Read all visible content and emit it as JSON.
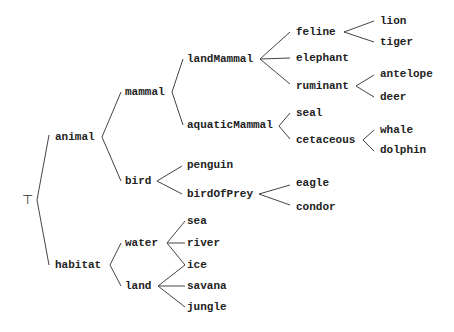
{
  "diagram": {
    "type": "taxonomy-tree",
    "root": "⊤",
    "nodes": [
      {
        "id": "top",
        "label": "⊤",
        "x": 22,
        "y": 200,
        "root": true
      },
      {
        "id": "animal",
        "label": "animal",
        "x": 55,
        "y": 137,
        "parent": "top"
      },
      {
        "id": "habitat",
        "label": "habitat",
        "x": 55,
        "y": 265,
        "parent": "top"
      },
      {
        "id": "mammal",
        "label": "mammal",
        "x": 125,
        "y": 92,
        "parent": "animal"
      },
      {
        "id": "bird",
        "label": "bird",
        "x": 125,
        "y": 181,
        "parent": "animal"
      },
      {
        "id": "landMammal",
        "label": "landMammal",
        "x": 187,
        "y": 59,
        "parent": "mammal"
      },
      {
        "id": "aquaticMammal",
        "label": "aquaticMammal",
        "x": 187,
        "y": 125,
        "parent": "mammal"
      },
      {
        "id": "feline",
        "label": "feline",
        "x": 296,
        "y": 32,
        "parent": "landMammal"
      },
      {
        "id": "elephant",
        "label": "elephant",
        "x": 296,
        "y": 58,
        "parent": "landMammal"
      },
      {
        "id": "ruminant",
        "label": "ruminant",
        "x": 296,
        "y": 86,
        "parent": "landMammal"
      },
      {
        "id": "lion",
        "label": "lion",
        "x": 380,
        "y": 21,
        "parent": "feline"
      },
      {
        "id": "tiger",
        "label": "tiger",
        "x": 380,
        "y": 42,
        "parent": "feline"
      },
      {
        "id": "antelope",
        "label": "antelope",
        "x": 380,
        "y": 74,
        "parent": "ruminant"
      },
      {
        "id": "deer",
        "label": "deer",
        "x": 380,
        "y": 97,
        "parent": "ruminant"
      },
      {
        "id": "seal",
        "label": "seal",
        "x": 296,
        "y": 113,
        "parent": "aquaticMammal"
      },
      {
        "id": "cetaceous",
        "label": "cetaceous",
        "x": 296,
        "y": 140,
        "parent": "aquaticMammal"
      },
      {
        "id": "whale",
        "label": "whale",
        "x": 380,
        "y": 130,
        "parent": "cetaceous"
      },
      {
        "id": "dolphin",
        "label": "dolphin",
        "x": 380,
        "y": 150,
        "parent": "cetaceous"
      },
      {
        "id": "penguin",
        "label": "penguin",
        "x": 187,
        "y": 165,
        "parent": "bird"
      },
      {
        "id": "birdOfPrey",
        "label": "birdOfPrey",
        "x": 187,
        "y": 194,
        "parent": "bird"
      },
      {
        "id": "eagle",
        "label": "eagle",
        "x": 296,
        "y": 183,
        "parent": "birdOfPrey"
      },
      {
        "id": "condor",
        "label": "condor",
        "x": 296,
        "y": 207,
        "parent": "birdOfPrey"
      },
      {
        "id": "water",
        "label": "water",
        "x": 125,
        "y": 243,
        "parent": "habitat"
      },
      {
        "id": "land",
        "label": "land",
        "x": 125,
        "y": 286,
        "parent": "habitat"
      },
      {
        "id": "sea",
        "label": "sea",
        "x": 187,
        "y": 221,
        "parent": "water"
      },
      {
        "id": "river",
        "label": "river",
        "x": 187,
        "y": 243,
        "parent": "water"
      },
      {
        "id": "ice",
        "label": "ice",
        "x": 187,
        "y": 265,
        "parents": [
          "water",
          "land"
        ]
      },
      {
        "id": "savana",
        "label": "savana",
        "x": 187,
        "y": 286,
        "parent": "land"
      },
      {
        "id": "jungle",
        "label": "jungle",
        "x": 187,
        "y": 307,
        "parent": "land"
      }
    ],
    "edges": [
      {
        "x1": 37,
        "y1": 200,
        "x2": 49,
        "y2": 135
      },
      {
        "x1": 37,
        "y1": 200,
        "x2": 49,
        "y2": 265
      },
      {
        "x1": 102,
        "y1": 137,
        "x2": 121,
        "y2": 92
      },
      {
        "x1": 102,
        "y1": 137,
        "x2": 121,
        "y2": 181
      },
      {
        "x1": 172,
        "y1": 92,
        "x2": 183,
        "y2": 59
      },
      {
        "x1": 172,
        "y1": 92,
        "x2": 183,
        "y2": 125
      },
      {
        "x1": 260,
        "y1": 59,
        "x2": 290,
        "y2": 32
      },
      {
        "x1": 260,
        "y1": 59,
        "x2": 290,
        "y2": 58
      },
      {
        "x1": 260,
        "y1": 59,
        "x2": 290,
        "y2": 84
      },
      {
        "x1": 344,
        "y1": 32,
        "x2": 374,
        "y2": 21
      },
      {
        "x1": 344,
        "y1": 32,
        "x2": 374,
        "y2": 42
      },
      {
        "x1": 356,
        "y1": 86,
        "x2": 374,
        "y2": 75
      },
      {
        "x1": 356,
        "y1": 86,
        "x2": 374,
        "y2": 97
      },
      {
        "x1": 279,
        "y1": 126,
        "x2": 290,
        "y2": 113
      },
      {
        "x1": 279,
        "y1": 126,
        "x2": 290,
        "y2": 139
      },
      {
        "x1": 363,
        "y1": 140,
        "x2": 374,
        "y2": 130
      },
      {
        "x1": 363,
        "y1": 140,
        "x2": 374,
        "y2": 151
      },
      {
        "x1": 157,
        "y1": 181,
        "x2": 182,
        "y2": 166
      },
      {
        "x1": 157,
        "y1": 181,
        "x2": 182,
        "y2": 194
      },
      {
        "x1": 259,
        "y1": 194,
        "x2": 290,
        "y2": 185
      },
      {
        "x1": 259,
        "y1": 194,
        "x2": 290,
        "y2": 205
      },
      {
        "x1": 110,
        "y1": 265,
        "x2": 121,
        "y2": 243
      },
      {
        "x1": 110,
        "y1": 265,
        "x2": 121,
        "y2": 286
      },
      {
        "x1": 167,
        "y1": 243,
        "x2": 185,
        "y2": 221
      },
      {
        "x1": 167,
        "y1": 243,
        "x2": 185,
        "y2": 243
      },
      {
        "x1": 167,
        "y1": 243,
        "x2": 185,
        "y2": 265
      },
      {
        "x1": 158,
        "y1": 286,
        "x2": 185,
        "y2": 265
      },
      {
        "x1": 158,
        "y1": 286,
        "x2": 185,
        "y2": 286
      },
      {
        "x1": 158,
        "y1": 286,
        "x2": 185,
        "y2": 307
      }
    ]
  }
}
